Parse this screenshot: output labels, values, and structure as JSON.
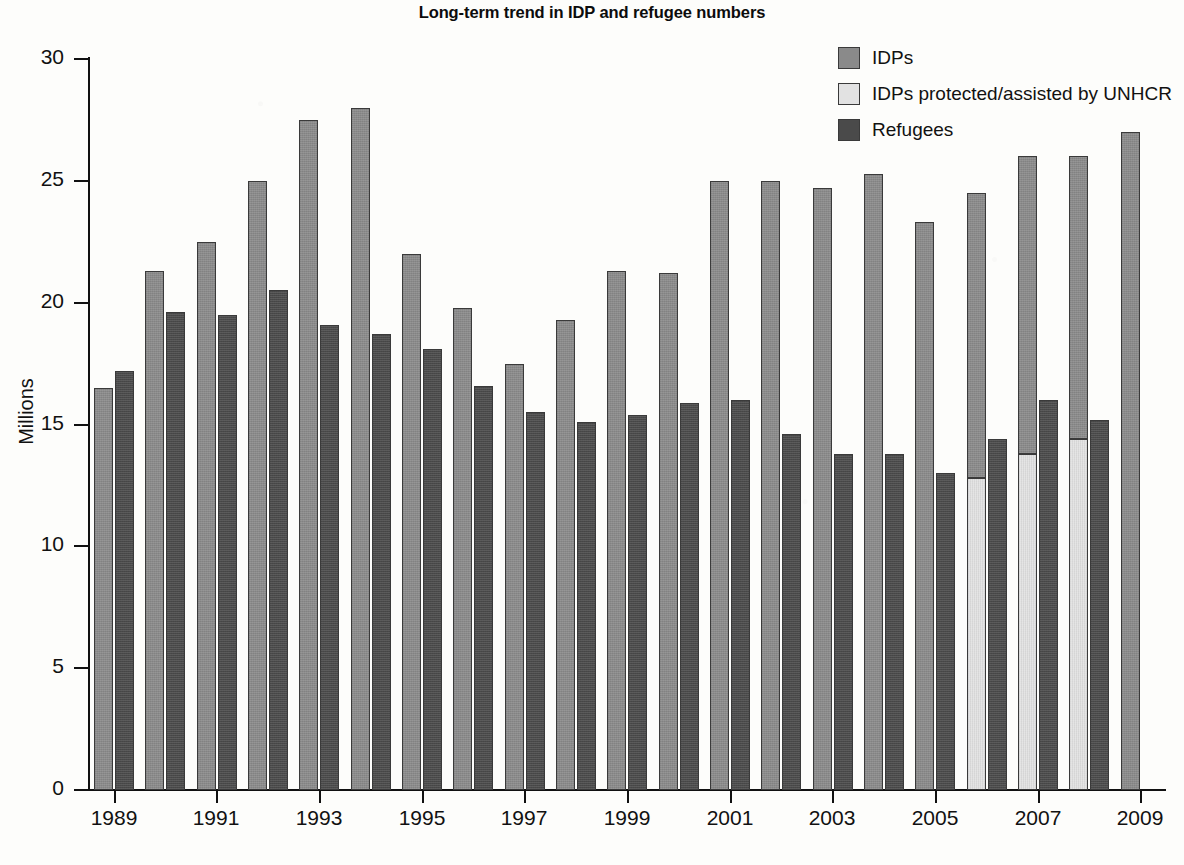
{
  "chart_data": {
    "type": "bar",
    "title": "Long-term trend in IDP and refugee numbers",
    "xlabel": "",
    "ylabel": "Millions",
    "ylim": [
      0,
      30
    ],
    "ytick_labels": [
      "0",
      "5",
      "10",
      "15",
      "20",
      "25",
      "30"
    ],
    "yticks": [
      0,
      5,
      10,
      15,
      20,
      25,
      30
    ],
    "grid": false,
    "legend_position": "top-right",
    "bar_mode": "grouped-with-stacked-idp",
    "categories": [
      "1989",
      "1990",
      "1991",
      "1992",
      "1993",
      "1994",
      "1995",
      "1996",
      "1997",
      "1998",
      "1999",
      "2000",
      "2001",
      "2002",
      "2003",
      "2004",
      "2005",
      "2006",
      "2007",
      "2008",
      "2009"
    ],
    "xtick_labels": [
      "1989",
      "1991",
      "1993",
      "1995",
      "1997",
      "1999",
      "2001",
      "2003",
      "2005",
      "2007",
      "2009"
    ],
    "series": [
      {
        "name": "IDPs",
        "color": "#8a8a8a",
        "values": [
          16.5,
          21.3,
          22.5,
          25.0,
          27.5,
          28.0,
          22.0,
          19.8,
          17.5,
          19.3,
          21.3,
          21.2,
          25.0,
          25.0,
          24.7,
          25.3,
          23.3,
          24.5,
          26.0,
          26.0,
          27.0
        ]
      },
      {
        "name": "IDPs protected/assisted by UNHCR",
        "color": "#e2e2e2",
        "values": [
          null,
          null,
          null,
          null,
          null,
          null,
          null,
          null,
          null,
          null,
          null,
          null,
          null,
          null,
          null,
          null,
          null,
          12.8,
          13.8,
          14.4,
          null
        ]
      },
      {
        "name": "Refugees",
        "color": "#4a4a4a",
        "values": [
          17.2,
          19.6,
          19.5,
          20.5,
          19.1,
          18.7,
          18.1,
          16.6,
          15.5,
          15.1,
          15.4,
          15.9,
          16.0,
          14.6,
          13.8,
          13.8,
          13.0,
          14.4,
          16.0,
          15.2,
          null
        ]
      }
    ]
  },
  "legend": {
    "items": [
      {
        "label": "IDPs",
        "color": "#8a8a8a"
      },
      {
        "label": "IDPs protected/assisted by UNHCR",
        "color": "#e2e2e2"
      },
      {
        "label": "Refugees",
        "color": "#4a4a4a"
      }
    ]
  }
}
